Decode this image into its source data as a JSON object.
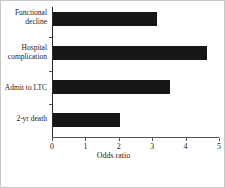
{
  "chart_data": {
    "type": "bar",
    "orientation": "horizontal",
    "title": "",
    "xlabel": "Odds ratio",
    "ylabel": "",
    "categories": [
      "Functional decline",
      "Hospital complication",
      "Admit to LTC",
      "2-yr death"
    ],
    "values": [
      3.1,
      4.6,
      3.5,
      2.0
    ],
    "xlim": [
      0,
      5
    ],
    "xticks": [
      0,
      1,
      2,
      3,
      4,
      5
    ],
    "xticklabels": [
      "0",
      "1",
      "2",
      "3",
      "4",
      "5"
    ],
    "grid": false,
    "legend": null,
    "bar_color": "#171717",
    "axis_color": "#555555",
    "background_color": "#ffffff",
    "frame_color": "#c8c8c8"
  },
  "labels": {
    "cat_0_line1": "Functional",
    "cat_0_line2": "decline",
    "cat_1_line1": "Hospital",
    "cat_1_line2": "complication",
    "cat_2_line1": "Admit to LTC",
    "cat_3_line1": "2-yr death"
  }
}
